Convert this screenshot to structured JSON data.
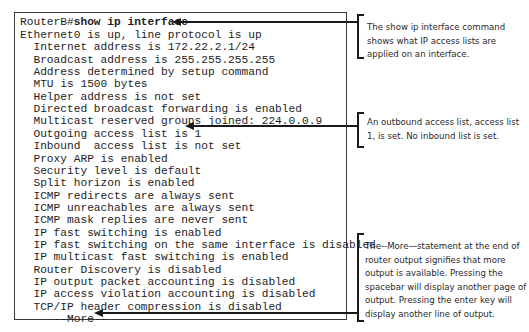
{
  "terminal": {
    "prompt": "RouterB#",
    "command": "show ip interface",
    "lines": [
      "Ethernet0 is up, line protocol is up",
      "  Internet address is 172.22.2.1/24",
      "  Broadcast address is 255.255.255.255",
      "  Address determined by setup command",
      "  MTU is 1500 bytes",
      "  Helper address is not set",
      "  Directed broadcast forwarding is enabled",
      "  Multicast reserved groups joined: 224.0.0.9",
      "  Outgoing access list is 1",
      "  Inbound  access list is not set",
      "  Proxy ARP is enabled",
      "  Security level is default",
      "  Split horizon is enabled",
      "  ICMP redirects are always sent",
      "  ICMP unreachables are always sent",
      "  ICMP mask replies are never sent",
      "  IP fast switching is enabled",
      "  IP fast switching on the same interface is disabled",
      "  IP multicast fast switching is enabled",
      "  Router Discovery is disabled",
      "  IP output packet accounting is disabled",
      "  IP access violation accounting is disabled",
      "  TCP/IP header compression is disabled",
      "     --More--"
    ]
  },
  "callouts": [
    {
      "id": "show-command",
      "text": "The show ip interface command shows what IP access lists are applied on an interface.",
      "target_line": "RouterB#show ip interface"
    },
    {
      "id": "access-list",
      "text": "An outbound access list, access list 1, is set. No inbound list is set.",
      "target_line": "Outgoing access list is 1"
    },
    {
      "id": "more-prompt",
      "text": "The--More—statement at the end of router output signifies that more output is available. Pressing the spacebar will display another page of output. Pressing the enter key will display another line of output.",
      "target_line": "--More--"
    }
  ]
}
